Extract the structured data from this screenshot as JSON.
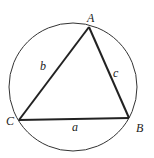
{
  "diagram": {
    "vertices": [
      {
        "name": "A",
        "x": 89,
        "y": 27
      },
      {
        "name": "B",
        "x": 129,
        "y": 118
      },
      {
        "name": "C",
        "x": 19,
        "y": 120
      }
    ],
    "sides": [
      {
        "name": "a",
        "from": "C",
        "to": "B"
      },
      {
        "name": "b",
        "from": "C",
        "to": "A"
      },
      {
        "name": "c",
        "from": "A",
        "to": "B"
      }
    ],
    "circle": {
      "cx": 73,
      "cy": 87,
      "r": 64
    },
    "labels": {
      "A": "A",
      "B": "B",
      "C": "C",
      "a": "a",
      "b": "b",
      "c": "c"
    },
    "colors": {
      "stroke": "#222222",
      "background": "#ffffff"
    }
  }
}
